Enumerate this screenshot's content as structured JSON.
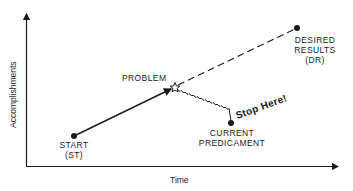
{
  "diagram": {
    "axes": {
      "x_label": "Time",
      "y_label": "Accomplishments"
    },
    "points": {
      "start": {
        "label_line1": "START",
        "label_line2": "(ST)"
      },
      "problem": {
        "label": "PROBLEM"
      },
      "current": {
        "label_line1": "CURRENT",
        "label_line2": "PREDICAMENT"
      },
      "desired": {
        "label_line1": "DESIRED",
        "label_line2": "RESULTS",
        "label_line3": "(DR)"
      }
    },
    "annotation": {
      "stop_text": "Stop Here!"
    },
    "colors": {
      "ink": "#1a1a1a",
      "background": "#ffffff"
    }
  }
}
